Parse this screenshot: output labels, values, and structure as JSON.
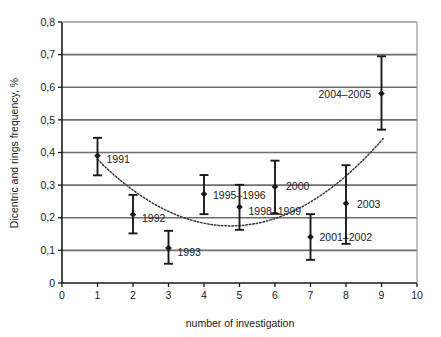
{
  "chart_data": {
    "type": "scatter",
    "title": "",
    "xlabel": "number of investigation",
    "ylabel": "Dicentric and rings frequency, %",
    "xlim": [
      0,
      10
    ],
    "ylim": [
      0,
      0.8
    ],
    "grid": true,
    "legend": "none",
    "x_ticks": [
      "0",
      "1",
      "2",
      "3",
      "4",
      "5",
      "6",
      "7",
      "8",
      "9",
      "10"
    ],
    "x_tick_values": [
      0,
      1,
      2,
      3,
      4,
      5,
      6,
      7,
      8,
      9,
      10
    ],
    "y_ticks": [
      "0",
      "0,1",
      "0,2",
      "0,3",
      "0,4",
      "0,5",
      "0,6",
      "0,7",
      "0,8"
    ],
    "y_tick_values": [
      0,
      0.1,
      0.2,
      0.3,
      0.4,
      0.5,
      0.6,
      0.7,
      0.8
    ],
    "decimal_separator": ",",
    "marker": "diamond",
    "marker_color": "#1a1a1a",
    "errorbar_color": "#1a1a1a",
    "trend_style": "dotted",
    "trend_color": "#3a3a3a",
    "points": [
      {
        "x": 1,
        "y": 0.39,
        "y_low": 0.33,
        "y_high": 0.445,
        "label": "1991",
        "label_dx": 9,
        "label_dy": 4
      },
      {
        "x": 2,
        "y": 0.21,
        "y_low": 0.152,
        "y_high": 0.27,
        "label": "1992",
        "label_dx": 9,
        "label_dy": 4
      },
      {
        "x": 3,
        "y": 0.107,
        "y_low": 0.059,
        "y_high": 0.16,
        "label": "1993",
        "label_dx": 9,
        "label_dy": 4
      },
      {
        "x": 4,
        "y": 0.273,
        "y_low": 0.211,
        "y_high": 0.331,
        "label": "1995–1996",
        "label_dx": 9,
        "label_dy": 1
      },
      {
        "x": 5,
        "y": 0.233,
        "y_low": 0.163,
        "y_high": 0.301,
        "label": "1998–1999",
        "label_dx": 9,
        "label_dy": 4
      },
      {
        "x": 6,
        "y": 0.295,
        "y_low": 0.212,
        "y_high": 0.375,
        "label": "2000",
        "label_dx": 11,
        "label_dy": 0
      },
      {
        "x": 7,
        "y": 0.141,
        "y_low": 0.071,
        "y_high": 0.211,
        "label": "2001–2002",
        "label_dx": 9,
        "label_dy": 0
      },
      {
        "x": 8,
        "y": 0.244,
        "y_low": 0.12,
        "y_high": 0.361,
        "label": "2003",
        "label_dx": 11,
        "label_dy": 1
      },
      {
        "x": 9,
        "y": 0.581,
        "y_low": 0.47,
        "y_high": 0.695,
        "label": "2004–2005",
        "label_dx": -63,
        "label_dy": 1
      }
    ],
    "trend_curve": {
      "description": "dotted U-shaped fitted curve",
      "x_start": 1.0,
      "x_end": 9.05,
      "vertex_x": 4.75,
      "vertex_y": 0.175,
      "a": 0.0145,
      "points": [
        {
          "x": 1.0,
          "y": 0.354
        },
        {
          "x": 1.5,
          "y": 0.301
        },
        {
          "x": 2.0,
          "y": 0.254
        },
        {
          "x": 2.5,
          "y": 0.215
        },
        {
          "x": 3.0,
          "y": 0.184
        },
        {
          "x": 3.5,
          "y": 0.2
        },
        {
          "x": 4.0,
          "y": 0.183
        },
        {
          "x": 4.5,
          "y": 0.176
        },
        {
          "x": 5.0,
          "y": 0.176
        },
        {
          "x": 5.5,
          "y": 0.185
        },
        {
          "x": 6.0,
          "y": 0.201
        },
        {
          "x": 6.5,
          "y": 0.226
        },
        {
          "x": 7.0,
          "y": 0.258
        },
        {
          "x": 7.5,
          "y": 0.298
        },
        {
          "x": 8.0,
          "y": 0.346
        },
        {
          "x": 8.5,
          "y": 0.402
        },
        {
          "x": 9.0,
          "y": 0.466
        }
      ]
    }
  },
  "colors": {
    "background": "#ffffff",
    "gridline": "#6e6e6e",
    "axis": "#1a1a1a",
    "text": "#1a1a1a"
  }
}
